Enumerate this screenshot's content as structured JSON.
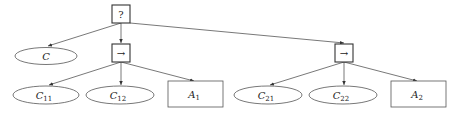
{
  "diagram": {
    "root": {
      "label": "?",
      "shape": "box"
    },
    "nodes": [
      {
        "id": "C",
        "label": "C",
        "sub": "",
        "shape": "ellipse"
      },
      {
        "id": "seq1",
        "label": "→",
        "sub": "",
        "shape": "box"
      },
      {
        "id": "seq2",
        "label": "→",
        "sub": "",
        "shape": "box"
      },
      {
        "id": "C11",
        "label": "C",
        "sub": "11",
        "shape": "ellipse"
      },
      {
        "id": "C12",
        "label": "C",
        "sub": "12",
        "shape": "ellipse"
      },
      {
        "id": "A1",
        "label": "A",
        "sub": "1",
        "shape": "rect"
      },
      {
        "id": "C21",
        "label": "C",
        "sub": "21",
        "shape": "ellipse"
      },
      {
        "id": "C22",
        "label": "C",
        "sub": "22",
        "shape": "ellipse"
      },
      {
        "id": "A2",
        "label": "A",
        "sub": "2",
        "shape": "rect"
      }
    ],
    "edges": [
      [
        "?",
        "C"
      ],
      [
        "?",
        "seq1"
      ],
      [
        "?",
        "seq2"
      ],
      [
        "seq1",
        "C11"
      ],
      [
        "seq1",
        "C12"
      ],
      [
        "seq1",
        "A1"
      ],
      [
        "seq2",
        "C21"
      ],
      [
        "seq2",
        "C22"
      ],
      [
        "seq2",
        "A2"
      ]
    ]
  }
}
